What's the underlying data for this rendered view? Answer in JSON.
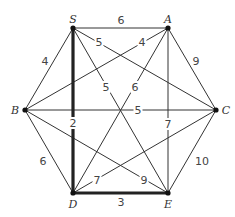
{
  "graph": {
    "nodes": [
      {
        "id": "S",
        "label": "S",
        "x": 73,
        "y": 28,
        "lx": 73,
        "ly": 19
      },
      {
        "id": "A",
        "label": "A",
        "x": 168,
        "y": 28,
        "lx": 168,
        "ly": 19
      },
      {
        "id": "B",
        "label": "B",
        "x": 25,
        "y": 110,
        "lx": 15,
        "ly": 110
      },
      {
        "id": "C",
        "label": "C",
        "x": 216,
        "y": 110,
        "lx": 226,
        "ly": 110
      },
      {
        "id": "D",
        "label": "D",
        "x": 73,
        "y": 193,
        "lx": 73,
        "ly": 204
      },
      {
        "id": "E",
        "label": "E",
        "x": 168,
        "y": 193,
        "lx": 168,
        "ly": 204
      }
    ],
    "edges": [
      {
        "from": "S",
        "to": "A",
        "weight": "6",
        "lx": 121,
        "ly": 20,
        "bold": false
      },
      {
        "from": "S",
        "to": "B",
        "weight": "4",
        "lx": 45,
        "ly": 61,
        "bold": false
      },
      {
        "from": "S",
        "to": "C",
        "weight": "5",
        "lx": 99,
        "ly": 42,
        "bold": false
      },
      {
        "from": "S",
        "to": "D",
        "weight": "2",
        "lx": 73,
        "ly": 123,
        "bold": true
      },
      {
        "from": "S",
        "to": "E",
        "weight": "5",
        "lx": 106,
        "ly": 87,
        "bold": false
      },
      {
        "from": "A",
        "to": "B",
        "weight": "4",
        "lx": 142,
        "ly": 42,
        "bold": false
      },
      {
        "from": "A",
        "to": "C",
        "weight": "9",
        "lx": 196,
        "ly": 61,
        "bold": false
      },
      {
        "from": "A",
        "to": "D",
        "weight": "6",
        "lx": 135,
        "ly": 87,
        "bold": false
      },
      {
        "from": "A",
        "to": "E",
        "weight": "7",
        "lx": 168,
        "ly": 124,
        "bold": false
      },
      {
        "from": "B",
        "to": "C",
        "weight": "5",
        "lx": 138,
        "ly": 110,
        "bold": false
      },
      {
        "from": "B",
        "to": "D",
        "weight": "6",
        "lx": 43,
        "ly": 161,
        "bold": false
      },
      {
        "from": "B",
        "to": "E",
        "weight": "9",
        "lx": 144,
        "ly": 180,
        "bold": false
      },
      {
        "from": "C",
        "to": "D",
        "weight": "7",
        "lx": 97,
        "ly": 180,
        "bold": false
      },
      {
        "from": "C",
        "to": "E",
        "weight": "10",
        "lx": 202,
        "ly": 161,
        "bold": false
      },
      {
        "from": "D",
        "to": "E",
        "weight": "3",
        "lx": 121,
        "ly": 202,
        "bold": true
      }
    ],
    "highlighted_path": [
      "S",
      "D",
      "E"
    ]
  }
}
